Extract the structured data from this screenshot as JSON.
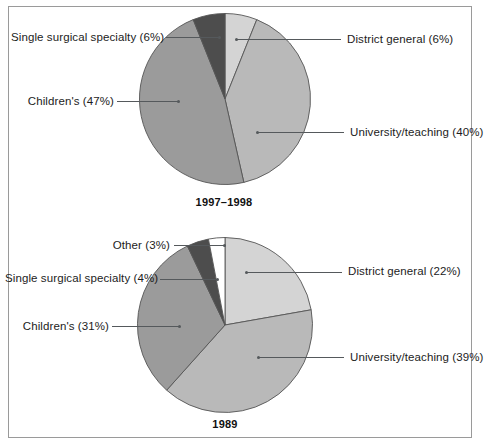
{
  "figure": {
    "title": "",
    "background": "#ffffff",
    "border_color": "#9a9a9a"
  },
  "palette": {
    "district_general": "#d4d4d4",
    "university_teaching": "#b9b9b9",
    "children": "#9b9b9b",
    "single_surgical_specialty": "#4d4d4d",
    "other": "#ffffff",
    "slice_outline": "#555555",
    "leader_line": "#55595c",
    "text": "#1c1c1c"
  },
  "chart_data": [
    {
      "type": "pie",
      "title": "1997–1998",
      "xlabel": "",
      "ylabel": "",
      "legend_position": "callout-labels",
      "grid": false,
      "start_angle_deg": 0,
      "direction": "clockwise",
      "categories": [
        "District general",
        "University/teaching",
        "Children's",
        "Single surgical specialty"
      ],
      "values": [
        6,
        40,
        47,
        6
      ],
      "unit": "%",
      "labels": [
        "District general (6%)",
        "University/teaching (40%)",
        "Children's (47%)",
        "Single surgical specialty (6%)"
      ],
      "colors": [
        "#d4d4d4",
        "#b9b9b9",
        "#9b9b9b",
        "#4d4d4d"
      ]
    },
    {
      "type": "pie",
      "title": "1989",
      "xlabel": "",
      "ylabel": "",
      "legend_position": "callout-labels",
      "grid": false,
      "start_angle_deg": 0,
      "direction": "clockwise",
      "categories": [
        "District general",
        "University/teaching",
        "Children's",
        "Single surgical specialty",
        "Other"
      ],
      "values": [
        22,
        39,
        31,
        4,
        3
      ],
      "unit": "%",
      "labels": [
        "District general (22%)",
        "University/teaching (39%)",
        "Children's (31%)",
        "Single surgical specialty (4%)",
        "Other (3%)"
      ],
      "colors": [
        "#d4d4d4",
        "#b9b9b9",
        "#9b9b9b",
        "#4d4d4d",
        "#ffffff"
      ]
    }
  ],
  "chart_top": {
    "caption": "1997–1998",
    "labels": {
      "single_surgical_specialty": "Single surgical specialty (6%)",
      "children": "Children's (47%)",
      "district_general": "District general (6%)",
      "university_teaching": "University/teaching (40%)"
    }
  },
  "chart_bottom": {
    "caption": "1989",
    "labels": {
      "other": "Other (3%)",
      "single_surgical_specialty": "Single surgical specialty (4%)",
      "children": "Children's (31%)",
      "district_general": "District general (22%)",
      "university_teaching": "University/teaching (39%)"
    }
  }
}
